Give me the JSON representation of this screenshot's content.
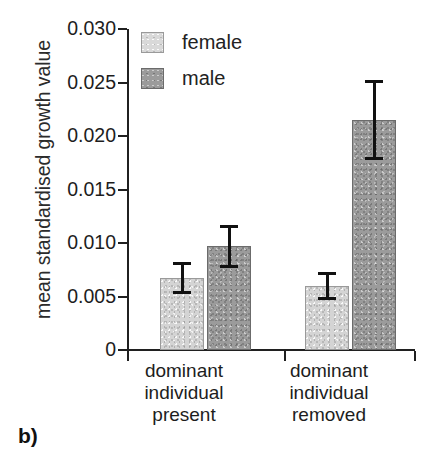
{
  "panel": {
    "label": "b)"
  },
  "chart_data": {
    "type": "bar",
    "title": "",
    "subtitle": "",
    "xlabel": "",
    "ylabel": "mean standardised growth value",
    "categories": [
      "dominant individual present",
      "dominant individual removed"
    ],
    "category_lines": [
      [
        "dominant",
        "individual",
        "present"
      ],
      [
        "dominant",
        "individual",
        "removed"
      ]
    ],
    "series": [
      {
        "name": "female",
        "color": "#d4d4d4",
        "values": [
          0.0067,
          0.006
        ],
        "errors": [
          0.0015,
          0.0013
        ],
        "error_low": [
          0.0052,
          0.0047
        ],
        "error_high": [
          0.0082,
          0.0073
        ]
      },
      {
        "name": "male",
        "color": "#9b9b9b",
        "values": [
          0.0097,
          0.0215
        ],
        "errors": [
          0.002,
          0.0037
        ],
        "error_low": [
          0.0077,
          0.0178
        ],
        "error_high": [
          0.0117,
          0.0252
        ]
      }
    ],
    "ylim": [
      0,
      0.03
    ],
    "yticks": [
      0,
      0.005,
      0.01,
      0.015,
      0.02,
      0.025,
      0.03
    ],
    "ytick_labels": [
      "0",
      "0.005",
      "0.010",
      "0.015",
      "0.020",
      "0.025",
      "0.030"
    ],
    "grid": false,
    "legend": [
      "female",
      "male"
    ],
    "legend_position": "top-left"
  }
}
